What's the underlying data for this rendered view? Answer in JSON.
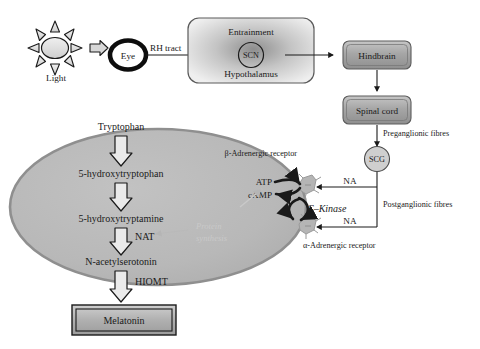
{
  "diagram": {
    "stimulus": {
      "sun_label": "Light",
      "eye_label": "Eye",
      "tract_label": "RH tract"
    },
    "brain": {
      "entrainment_label": "Entrainment",
      "scn_label": "SCN",
      "hypothalamus_label": "Hypothalamus",
      "hindbrain_label": "Hindbrain",
      "spinal_cord_label": "Spinal cord"
    },
    "fibres": {
      "preganglionic_label": "Preganglionic fibres",
      "postganglionic_label": "Postganglionic fibres",
      "ganglion_label": "SCG",
      "na_upper_label": "NA",
      "na_lower_label": "NA"
    },
    "receptors": {
      "beta_label": "β-Adrenergic receptor",
      "alpha_label": "α-Adrenergic receptor",
      "kinase_label": "C–Kinase",
      "atp_label": "ATP",
      "camp_label": "cAMP"
    },
    "pineal": {
      "step_1": "Tryptophan",
      "step_2": "5-hydroxytryptophan",
      "step_3": "5-hydroxytryptamine",
      "step_4": "N-acetylserotonin",
      "enzyme_nat": "NAT",
      "enzyme_hiomt": "HIOMT",
      "protein_synthesis_line_1": "Protein",
      "protein_synthesis_line_2": "synthesis",
      "product_label": "Melatonin"
    },
    "colors": {
      "ink": "#1a1a1a",
      "pineal_fill": "#b9b9b9",
      "pineal_stroke": "#8a8a8a",
      "box_fill_light": "#d9d9d9",
      "box_fill_dark": "#9a9a9a",
      "receptor_fill": "#b5b5b5",
      "ghost_text": "#c9c9c9"
    }
  }
}
